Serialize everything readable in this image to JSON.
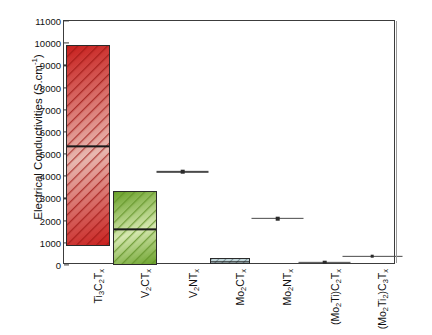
{
  "chart_data": {
    "type": "bar",
    "title": "",
    "xlabel": "",
    "ylabel": "Electrical Conductivities (S.cm-1)",
    "ylabel_base": "Electrical Conductivities (S.cm",
    "ylabel_sup": "-1",
    "ylabel_tail": ")",
    "ylim": [
      0,
      11000
    ],
    "ytick_values": [
      0,
      1000,
      2000,
      3000,
      4000,
      5000,
      6000,
      7000,
      8000,
      9000,
      10000,
      11000
    ],
    "ytick_labels": [
      "0",
      "1000",
      "2000",
      "3000",
      "4000",
      "5000",
      "6000",
      "7000",
      "8000",
      "9000",
      "10000",
      "11000"
    ],
    "grid": false,
    "legend": "none",
    "categories": [
      "Ti3C2Tx",
      "V2CTx",
      "V2NTx",
      "Mo2CTx",
      "Mo2NTx",
      "(Mo2Ti)C2Tx",
      "(Mo2Ti2)C3Tx"
    ],
    "category_labels": [
      [
        {
          "t": "Ti",
          "s": false
        },
        {
          "t": "3",
          "s": true
        },
        {
          "t": "C",
          "s": false
        },
        {
          "t": "2",
          "s": true
        },
        {
          "t": "T",
          "s": false
        },
        {
          "t": "x",
          "s": true
        }
      ],
      [
        {
          "t": "V",
          "s": false
        },
        {
          "t": "2",
          "s": true
        },
        {
          "t": "CT",
          "s": false
        },
        {
          "t": "x",
          "s": true
        }
      ],
      [
        {
          "t": "V",
          "s": false
        },
        {
          "t": "2",
          "s": true
        },
        {
          "t": "NT",
          "s": false
        },
        {
          "t": "x",
          "s": true
        }
      ],
      [
        {
          "t": "Mo",
          "s": false
        },
        {
          "t": "2",
          "s": true
        },
        {
          "t": "CT",
          "s": false
        },
        {
          "t": "x",
          "s": true
        }
      ],
      [
        {
          "t": "Mo",
          "s": false
        },
        {
          "t": "2",
          "s": true
        },
        {
          "t": "NT",
          "s": false
        },
        {
          "t": "x",
          "s": true
        }
      ],
      [
        {
          "t": "(Mo",
          "s": false
        },
        {
          "t": "2",
          "s": true
        },
        {
          "t": "Ti)C",
          "s": false
        },
        {
          "t": "2",
          "s": true
        },
        {
          "t": "T",
          "s": false
        },
        {
          "t": "x",
          "s": true
        }
      ],
      [
        {
          "t": "(Mo",
          "s": false
        },
        {
          "t": "2",
          "s": true
        },
        {
          "t": "Ti",
          "s": false
        },
        {
          "t": "2",
          "s": true
        },
        {
          "t": ")C",
          "s": false
        },
        {
          "t": "3",
          "s": true
        },
        {
          "t": "T",
          "s": false
        },
        {
          "t": "x",
          "s": true
        }
      ]
    ],
    "series": [
      {
        "name": "range-bars",
        "kind": "range-bar",
        "items": [
          {
            "category": "Ti3C2Tx",
            "low": 850,
            "high": 9900,
            "median": 5400,
            "color": "#c8201e",
            "color2": "#e8b8b0"
          },
          {
            "category": "V2CTx",
            "low": 0,
            "high": 3350,
            "median": 1650,
            "color": "#6aa12a",
            "color2": "#d6e8b0"
          },
          {
            "category": "Mo2CTx",
            "low": 50,
            "high": 330,
            "median": 200,
            "color": "#bfd4d8",
            "color2": "#bfd4d8"
          }
        ]
      },
      {
        "name": "point-markers",
        "kind": "point-errorbar",
        "items": [
          {
            "category": "V2NTx",
            "value": 4200,
            "err_low": 3500,
            "err_high": 4950
          },
          {
            "category": "Mo2NTx",
            "value": 2100,
            "err_low": 1450,
            "err_high": 2800
          },
          {
            "category": "(Mo2Ti)C2Tx",
            "value": 120,
            "err_low": -500,
            "err_high": 760
          },
          {
            "category": "(Mo2Ti2)C3Tx",
            "value": 390,
            "err_low": -100,
            "err_high": 900
          }
        ]
      }
    ]
  },
  "axis": {
    "y_title_full": "Electrical Conductivities (S.cm-1)"
  },
  "colors": {
    "bar_red": "#c8201e",
    "bar_green": "#6aa12a",
    "bar_teal": "#bfd4d8",
    "frame": "#3c3c3c",
    "marker": "#2b2b2b",
    "errorbar": "#4a4a4a"
  }
}
